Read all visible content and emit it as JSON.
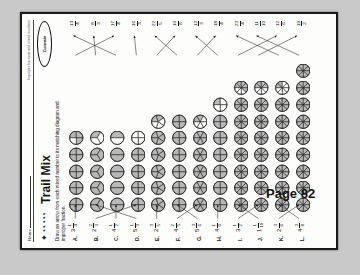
{
  "page": {
    "page_label": "Page 82",
    "background": "#c9c9c9",
    "paper": "#fdfdfb"
  },
  "header": {
    "name_label": "Name",
    "strand_label": "Improper fractions and mixed numbers",
    "logo_text": "Cuisenaire",
    "deco_text": "✦ ◔◔ ◔◔◔",
    "title": "Trail Mix",
    "instructions": "Draw an arrow from each mixed number to its matching diagram and improper fraction."
  },
  "chart_data": {
    "type": "table",
    "title": "Trail Mix",
    "xlabel": "",
    "ylabel": "",
    "columns": [
      "letter",
      "mixed_number",
      "diagram",
      "improper_fraction"
    ],
    "rows": [
      {
        "letter": "A.",
        "whole": "3",
        "num": "1",
        "den": "4",
        "circles": 5,
        "last_shaded": 3,
        "parts": 4,
        "improper_num": "13",
        "improper_den": "4"
      },
      {
        "letter": "B.",
        "whole": "2",
        "num": "2",
        "den": "3",
        "circles": 5,
        "last_shaded": 1,
        "parts": 3,
        "improper_num": "8",
        "improper_den": "3"
      },
      {
        "letter": "C.",
        "whole": "4",
        "num": "1",
        "den": "2",
        "circles": 5,
        "last_shaded": 1,
        "parts": 2,
        "improper_num": "17",
        "improper_den": "4"
      },
      {
        "letter": "D.",
        "whole": "5",
        "num": "1",
        "den": "3",
        "circles": 5,
        "last_shaded": 0,
        "parts": 4,
        "improper_num": "16",
        "improper_den": "3"
      },
      {
        "letter": "E.",
        "whole": "2",
        "num": "3",
        "den": "5",
        "circles": 6,
        "last_shaded": 2,
        "parts": 5,
        "improper_num": "22",
        "improper_den": "5"
      },
      {
        "letter": "F.",
        "whole": "4",
        "num": "2",
        "den": "5",
        "circles": 6,
        "last_shaded": 4,
        "parts": 4,
        "improper_num": "10",
        "improper_den": "6"
      },
      {
        "letter": "G.",
        "whole": "5",
        "num": "3",
        "den": "6",
        "circles": 6,
        "last_shaded": 2,
        "parts": 6,
        "improper_num": "13",
        "improper_den": "3"
      },
      {
        "letter": "H.",
        "whole": "4",
        "num": "1",
        "den": "6",
        "circles": 7,
        "last_shaded": 1,
        "parts": 4,
        "improper_num": "18",
        "improper_den": "4"
      },
      {
        "letter": "I.",
        "whole": "3",
        "num": "1",
        "den": "2",
        "circles": 8,
        "last_shaded": 5,
        "parts": 8,
        "improper_num": "23",
        "improper_den": "4"
      },
      {
        "letter": "J.",
        "whole": "1",
        "num": "1",
        "den": "10",
        "circles": 8,
        "last_shaded": 4,
        "parts": 8,
        "improper_num": "11",
        "improper_den": "10"
      },
      {
        "letter": "K.",
        "whole": "2",
        "num": "3",
        "den": "6",
        "circles": 8,
        "last_shaded": 2,
        "parts": 8,
        "improper_num": "12",
        "improper_den": "6"
      },
      {
        "letter": "L.",
        "whole": "4",
        "num": "3",
        "den": "8",
        "circles": 9,
        "last_shaded": 8,
        "parts": 8,
        "improper_num": "19",
        "improper_den": "2"
      }
    ],
    "improper_row_top": [
      "13/4",
      "8/3",
      "17/4",
      "16/3",
      "22/5",
      "10/6",
      "13/3",
      "18/4",
      "23/4",
      "11/10",
      "12/6",
      "19/2"
    ],
    "arrow_count": 24,
    "grid": false,
    "legend": "none"
  }
}
